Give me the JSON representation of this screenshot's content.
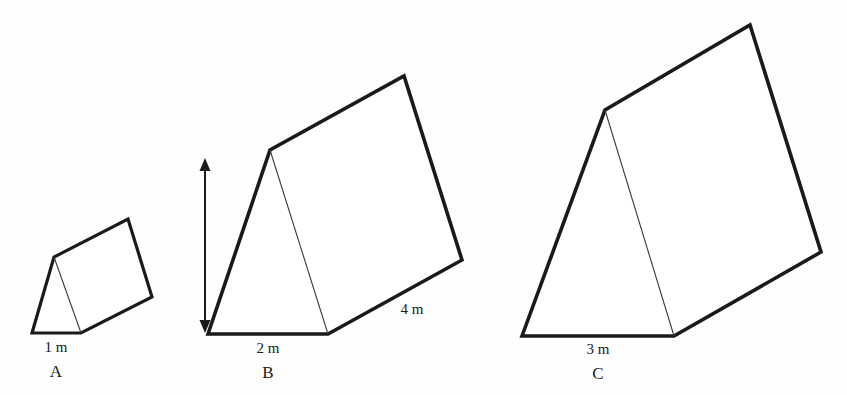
{
  "figure": {
    "background_color": "#fefefe",
    "stroke_color": "#1a1a1a",
    "inner_edge_color": "#3a3a3a"
  },
  "prisms": [
    {
      "id": "A",
      "label": "A",
      "base_label": "1 m",
      "outline_points": "32,333 54,257 128,219 152,297 81,333",
      "inner_edge": "54,257 81,333",
      "stroke_width": 3.2,
      "label_pos": {
        "base_x": 56,
        "base_y": 352,
        "letter_x": 56,
        "letter_y": 377
      }
    },
    {
      "id": "B",
      "label": "B",
      "base_label": "2 m",
      "slant_label": "4 m",
      "outline_points": "208,334 270,150 404,76 462,260 328,334",
      "inner_edge": "270,150 328,334",
      "stroke_width": 3.6,
      "label_pos": {
        "base_x": 268,
        "base_y": 353,
        "letter_x": 268,
        "letter_y": 378
      },
      "slant_label_pos": {
        "x": 412,
        "y": 314
      }
    },
    {
      "id": "C",
      "label": "C",
      "base_label": "3 m",
      "outline_points": "522,336 605,110 750,25 821,252 674,336",
      "inner_edge": "605,110 674,336",
      "stroke_width": 3.6,
      "label_pos": {
        "base_x": 598,
        "base_y": 354,
        "letter_x": 598,
        "letter_y": 379
      }
    }
  ],
  "height_dimension": {
    "label": "3 m",
    "line_x": 205,
    "line_top": 158,
    "line_bottom": 333,
    "label_x": 186,
    "label_y": 243
  }
}
